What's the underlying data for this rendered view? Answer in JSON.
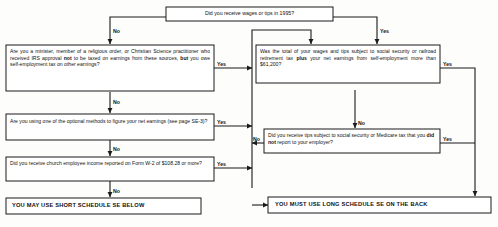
{
  "diagram": {
    "type": "decision-flowchart",
    "edge_labels": {
      "yes": "Yes",
      "no": "No"
    },
    "nodes": {
      "start": {
        "id": "q-wages-tips",
        "text": "Did you receive wages or tips in 1995?"
      },
      "left1": {
        "id": "q-minister",
        "html": "Are you a minister, member of a religious order, or Christian Science practitioner who received IRS approval <b>not</b> to be taxed on earnings from these sources, <b>but</b> you owe self-employment tax on other earnings?"
      },
      "left2": {
        "id": "q-optional-methods",
        "html": "Are you using one of the optional methods to figure your net earnings (see page SE-3)?"
      },
      "left3": {
        "id": "q-church-income",
        "html": "Did you receive church employee income reported on Form W-2 of $108.28 or more?"
      },
      "right1": {
        "id": "q-wage-base",
        "html": "Was the total of your wages and tips subject to social security or railroad retirement tax <b>plus</b> your net earnings from self-employment more than $61,200?"
      },
      "right2": {
        "id": "q-unreported-tips",
        "html": "Did you receive tips subject to social security or Medicare tax that you <b>did not</b> report to your employer?"
      },
      "result_short": {
        "id": "result-short-schedule",
        "text": "YOU MAY USE SHORT SCHEDULE SE BELOW"
      },
      "result_long": {
        "id": "result-long-schedule",
        "text": "YOU MUST USE LONG SCHEDULE SE ON THE BACK"
      }
    },
    "edges": [
      {
        "from": "start",
        "to": "left1",
        "label": "No"
      },
      {
        "from": "start",
        "to": "right1",
        "label": "Yes"
      },
      {
        "from": "left1",
        "to": "right1",
        "label": "Yes"
      },
      {
        "from": "left1",
        "to": "left2",
        "label": "No"
      },
      {
        "from": "left2",
        "to": "right1",
        "label": "Yes"
      },
      {
        "from": "left2",
        "to": "left3",
        "label": "No"
      },
      {
        "from": "left3",
        "to": "right1",
        "label": "Yes"
      },
      {
        "from": "left3",
        "to": "result_short",
        "label": "No"
      },
      {
        "from": "right1",
        "to": "result_long",
        "label": "Yes"
      },
      {
        "from": "right1",
        "to": "right2",
        "label": "No"
      },
      {
        "from": "right2",
        "to": "result_long",
        "label": "Yes"
      },
      {
        "from": "right2",
        "to": "right1",
        "label": "No"
      }
    ],
    "colors": {
      "line": "#1a1a1a",
      "box_fill": "#ffffff",
      "text": "#111111",
      "background": "#fdfdfc"
    }
  }
}
